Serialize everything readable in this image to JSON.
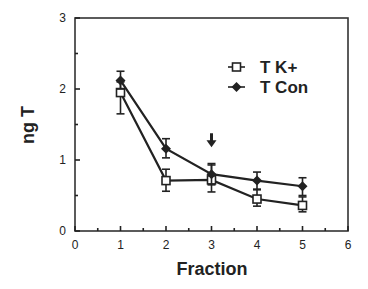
{
  "chart_data": {
    "type": "line",
    "title": "",
    "xlabel": "Fraction",
    "ylabel": "ng T",
    "xlim": [
      0,
      6
    ],
    "ylim": [
      0,
      3
    ],
    "x_ticks": [
      "0",
      "1",
      "2",
      "3",
      "4",
      "5",
      "6"
    ],
    "y_ticks": [
      "0",
      "1",
      "2",
      "3"
    ],
    "grid": false,
    "legend_position": "upper right (inside plot)",
    "x": [
      1,
      2,
      3,
      4,
      5
    ],
    "series": [
      {
        "name": "T  K+",
        "marker": "open-square",
        "values": [
          1.95,
          0.71,
          0.72,
          0.45,
          0.36
        ],
        "error_upper": [
          2.1,
          0.87,
          0.95,
          0.58,
          0.48
        ],
        "error_lower": [
          1.65,
          0.56,
          0.55,
          0.35,
          0.27
        ]
      },
      {
        "name": "T  Con",
        "marker": "filled-diamond",
        "values": [
          2.12,
          1.16,
          0.8,
          0.71,
          0.63
        ],
        "error_upper": [
          2.25,
          1.3,
          0.93,
          0.83,
          0.75
        ],
        "error_lower": [
          2.0,
          1.03,
          0.65,
          0.59,
          0.5
        ]
      }
    ],
    "annotations": [
      {
        "type": "down-arrow",
        "x": 3,
        "y": 1.25,
        "text": ""
      }
    ]
  }
}
